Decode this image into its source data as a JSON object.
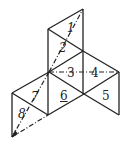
{
  "diagram": {
    "type": "net of triangular faces",
    "labels": [
      "1",
      "2",
      "3",
      "4",
      "5",
      "6",
      "7",
      "8"
    ]
  }
}
